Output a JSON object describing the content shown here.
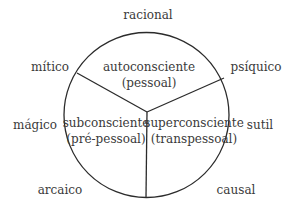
{
  "diagram": {
    "outer_labels": {
      "racional": "racional",
      "mitico": "mítico",
      "psiquico": "psíquico",
      "magico": "mágico",
      "sutil": "sutil",
      "arcaico": "arcaico",
      "causal": "causal"
    },
    "regions": {
      "top": {
        "line1": "autoconsciente",
        "line2": "(pessoal)"
      },
      "left": {
        "line1": "subconsciente",
        "line2": "(pré-pessoal)"
      },
      "right": {
        "line1": "superconsciente",
        "line2": "(transpessoal)"
      }
    },
    "colors": {
      "stroke": "#2b2b2b",
      "text": "#3a3a3a",
      "background": "#ffffff"
    }
  }
}
